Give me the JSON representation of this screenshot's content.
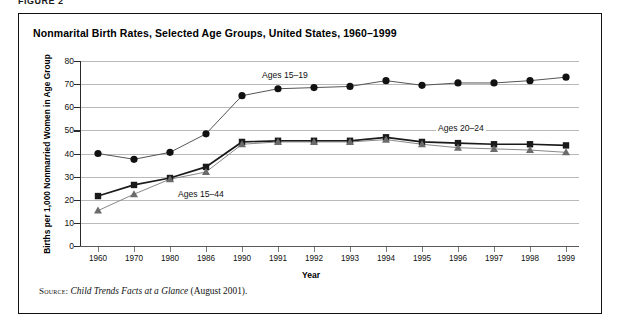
{
  "figure": {
    "kicker": "FIGURE 2",
    "title": "Nonmarital Birth Rates, Selected Age Groups, United States, 1960–1999"
  },
  "source": {
    "label": "Source:",
    "italic_text": "Child Trends Facts at a Glance",
    "trailing_text": "(August 2001)."
  },
  "annotations": {
    "ages_15_19": "Ages 15–19",
    "ages_20_24": "Ages 20–24",
    "ages_15_44": "Ages 15–44"
  },
  "colors": {
    "line": "#303030",
    "marker_circle": "#111111",
    "marker_square": "#1a1a1a",
    "marker_triangle": "#6b6b6b",
    "grid": "#b9b9b9",
    "frame": "#111111"
  },
  "chart_data": {
    "type": "line",
    "title": "Nonmarital Birth Rates, Selected Age Groups, United States, 1960–1999",
    "xlabel": "Year",
    "ylabel": "Births per 1,000 Nonmarried Women in Age Group",
    "categories": [
      "1960",
      "1970",
      "1980",
      "1986",
      "1990",
      "1991",
      "1992",
      "1993",
      "1994",
      "1995",
      "1996",
      "1997",
      "1998",
      "1999"
    ],
    "ylim": [
      0,
      80
    ],
    "yticks": [
      0,
      10,
      20,
      30,
      40,
      50,
      60,
      70,
      80
    ],
    "grid": true,
    "legend_position": "inline-annotations",
    "series": [
      {
        "name": "Ages 20–24",
        "marker": "circle",
        "values": [
          40,
          37.5,
          40.5,
          48.5,
          65,
          68,
          68.5,
          69,
          71.5,
          69.5,
          70.5,
          70.5,
          71.5,
          73
        ]
      },
      {
        "name": "Ages 15–44",
        "marker": "square",
        "values": [
          21.6,
          26.4,
          29.4,
          34.2,
          45,
          45.5,
          45.5,
          45.5,
          47,
          45,
          44.5,
          44,
          44,
          43.5
        ]
      },
      {
        "name": "Ages 15–19",
        "marker": "triangle",
        "values": [
          15.3,
          22.4,
          28.9,
          32,
          44,
          45,
          45,
          45,
          46,
          44,
          42.5,
          42,
          41.5,
          40.5
        ]
      }
    ]
  }
}
